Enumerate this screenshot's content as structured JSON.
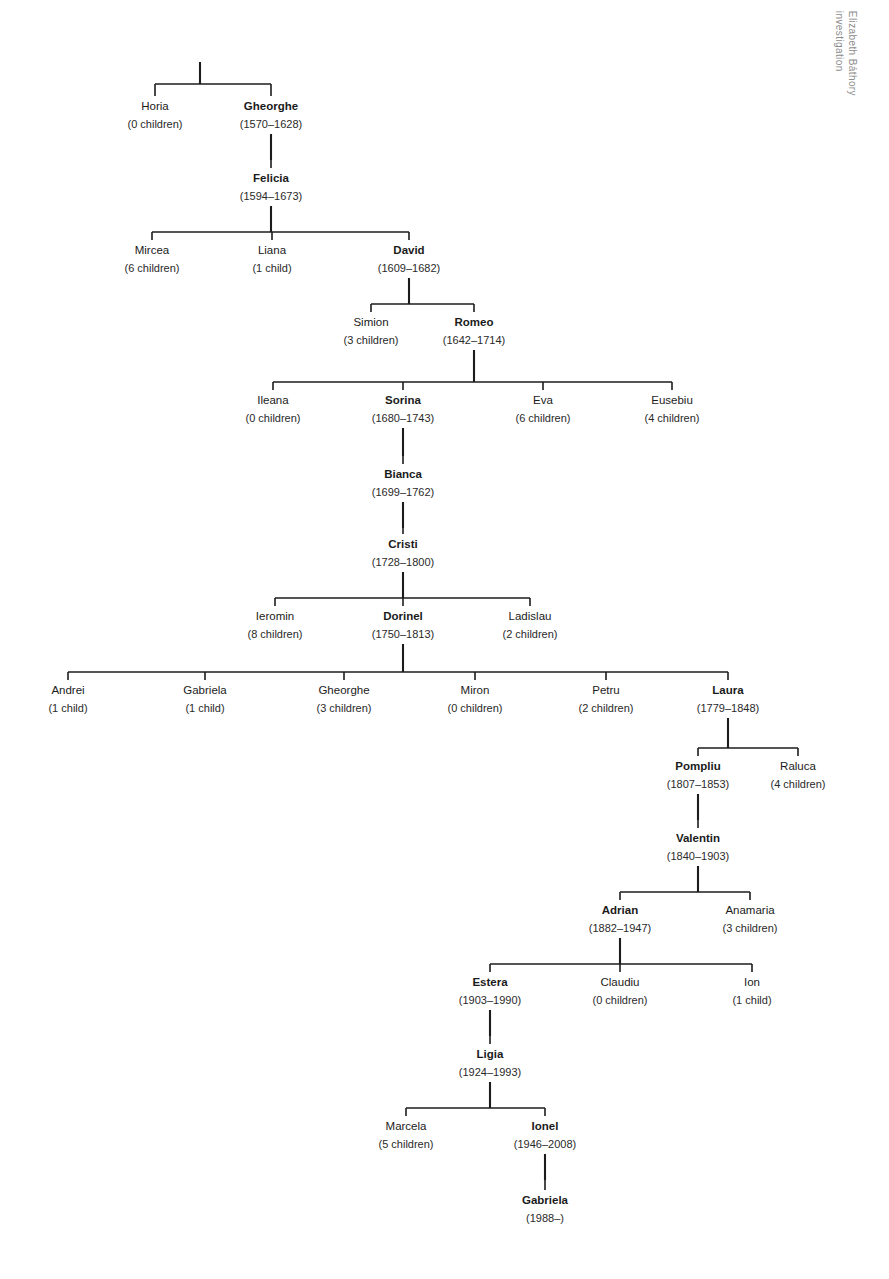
{
  "document": {
    "kind": "family-tree-diagram",
    "side_note_lines": [
      "Elizabeth Báthory",
      "investigation"
    ]
  },
  "style": {
    "background": "#ffffff",
    "ink": "#1c1c1c",
    "text": "#1b1b1b",
    "note_color": "#8c8c8c"
  },
  "chart_data": {
    "type": "tree",
    "title": "",
    "root_label": ""
  },
  "tree": {
    "generations": [
      {
        "id": "gen1",
        "y_name": 110,
        "y_sub": 128,
        "nodes": [
          {
            "id": "horia",
            "name": "Horia",
            "sub": "(0 children)",
            "x": 155,
            "bold": false
          },
          {
            "id": "gheorghe1",
            "name": "Gheorghe",
            "sub": "(1570–1628)",
            "x": 271,
            "bold": true
          }
        ]
      },
      {
        "id": "gen2",
        "y_name": 182,
        "y_sub": 200,
        "nodes": [
          {
            "id": "felicia",
            "name": "Felicia",
            "sub": "(1594–1673)",
            "x": 271,
            "bold": true
          }
        ]
      },
      {
        "id": "gen3",
        "y_name": 254,
        "y_sub": 272,
        "nodes": [
          {
            "id": "mircea",
            "name": "Mircea",
            "sub": "(6 children)",
            "x": 152,
            "bold": false
          },
          {
            "id": "liana",
            "name": "Liana",
            "sub": "(1 child)",
            "x": 272,
            "bold": false
          },
          {
            "id": "david",
            "name": "David",
            "sub": "(1609–1682)",
            "x": 409,
            "bold": true
          }
        ]
      },
      {
        "id": "gen4",
        "y_name": 326,
        "y_sub": 344,
        "nodes": [
          {
            "id": "simion",
            "name": "Simion",
            "sub": "(3 children)",
            "x": 371,
            "bold": false
          },
          {
            "id": "romeo",
            "name": "Romeo",
            "sub": "(1642–1714)",
            "x": 474,
            "bold": true
          }
        ]
      },
      {
        "id": "gen5",
        "y_name": 404,
        "y_sub": 422,
        "nodes": [
          {
            "id": "ileana",
            "name": "Ileana",
            "sub": "(0 children)",
            "x": 273,
            "bold": false
          },
          {
            "id": "sorina",
            "name": "Sorina",
            "sub": "(1680–1743)",
            "x": 403,
            "bold": true
          },
          {
            "id": "eva",
            "name": "Eva",
            "sub": "(6 children)",
            "x": 543,
            "bold": false
          },
          {
            "id": "eusebiu",
            "name": "Eusebiu",
            "sub": "(4 children)",
            "x": 672,
            "bold": false
          }
        ]
      },
      {
        "id": "gen6",
        "y_name": 478,
        "y_sub": 496,
        "nodes": [
          {
            "id": "bianca",
            "name": "Bianca",
            "sub": "(1699–1762)",
            "x": 403,
            "bold": true
          }
        ]
      },
      {
        "id": "gen7",
        "y_name": 548,
        "y_sub": 566,
        "nodes": [
          {
            "id": "cristi",
            "name": "Cristi",
            "sub": "(1728–1800)",
            "x": 403,
            "bold": true
          }
        ]
      },
      {
        "id": "gen8",
        "y_name": 620,
        "y_sub": 638,
        "nodes": [
          {
            "id": "ieromin",
            "name": "Ieromin",
            "sub": "(8 children)",
            "x": 275,
            "bold": false
          },
          {
            "id": "dorinel",
            "name": "Dorinel",
            "sub": "(1750–1813)",
            "x": 403,
            "bold": true
          },
          {
            "id": "ladislau",
            "name": "Ladislau",
            "sub": "(2 children)",
            "x": 530,
            "bold": false
          }
        ]
      },
      {
        "id": "gen9",
        "y_name": 694,
        "y_sub": 712,
        "nodes": [
          {
            "id": "andrei",
            "name": "Andrei",
            "sub": "(1 child)",
            "x": 68,
            "bold": false
          },
          {
            "id": "gabriela1",
            "name": "Gabriela",
            "sub": "(1 child)",
            "x": 205,
            "bold": false
          },
          {
            "id": "gheorghe2",
            "name": "Gheorghe",
            "sub": "(3 children)",
            "x": 344,
            "bold": false
          },
          {
            "id": "miron",
            "name": "Miron",
            "sub": "(0 children)",
            "x": 475,
            "bold": false
          },
          {
            "id": "petru",
            "name": "Petru",
            "sub": "(2 children)",
            "x": 606,
            "bold": false
          },
          {
            "id": "laura",
            "name": "Laura",
            "sub": "(1779–1848)",
            "x": 728,
            "bold": true
          }
        ]
      },
      {
        "id": "gen10",
        "y_name": 770,
        "y_sub": 788,
        "nodes": [
          {
            "id": "pompliu",
            "name": "Pompliu",
            "sub": "(1807–1853)",
            "x": 698,
            "bold": true
          },
          {
            "id": "raluca",
            "name": "Raluca",
            "sub": "(4 children)",
            "x": 798,
            "bold": false
          }
        ]
      },
      {
        "id": "gen11",
        "y_name": 842,
        "y_sub": 860,
        "nodes": [
          {
            "id": "valentin",
            "name": "Valentin",
            "sub": "(1840–1903)",
            "x": 698,
            "bold": true
          }
        ]
      },
      {
        "id": "gen12",
        "y_name": 914,
        "y_sub": 932,
        "nodes": [
          {
            "id": "adrian",
            "name": "Adrian",
            "sub": "(1882–1947)",
            "x": 620,
            "bold": true
          },
          {
            "id": "anamaria",
            "name": "Anamaria",
            "sub": "(3 children)",
            "x": 750,
            "bold": false
          }
        ]
      },
      {
        "id": "gen13",
        "y_name": 986,
        "y_sub": 1004,
        "nodes": [
          {
            "id": "estera",
            "name": "Estera",
            "sub": "(1903–1990)",
            "x": 490,
            "bold": true
          },
          {
            "id": "claudiu",
            "name": "Claudiu",
            "sub": "(0 children)",
            "x": 620,
            "bold": false
          },
          {
            "id": "ion",
            "name": "Ion",
            "sub": "(1 child)",
            "x": 752,
            "bold": false
          }
        ]
      },
      {
        "id": "gen14",
        "y_name": 1058,
        "y_sub": 1076,
        "nodes": [
          {
            "id": "ligia",
            "name": "Ligia",
            "sub": "(1924–1993)",
            "x": 490,
            "bold": true
          }
        ]
      },
      {
        "id": "gen15",
        "y_name": 1130,
        "y_sub": 1148,
        "nodes": [
          {
            "id": "marcela",
            "name": "Marcela",
            "sub": "(5 children)",
            "x": 406,
            "bold": false
          },
          {
            "id": "ionel",
            "name": "Ionel",
            "sub": "(1946–2008)",
            "x": 545,
            "bold": true
          }
        ]
      },
      {
        "id": "gen16",
        "y_name": 1204,
        "y_sub": 1222,
        "nodes": [
          {
            "id": "gabriela2",
            "name": "Gabriela",
            "sub": "(1988–)",
            "x": 545,
            "bold": true
          }
        ]
      }
    ],
    "edges": [
      {
        "id": "root-stub",
        "parent_x": 200,
        "parent_y": 62,
        "bar_y": 84,
        "child_y": 96,
        "children_x": [
          155,
          271
        ]
      },
      {
        "id": "gheorghe-felicia",
        "parent_x": 271,
        "parent_y": 134,
        "bar_y": 160,
        "child_y": 168,
        "children_x": [
          271
        ]
      },
      {
        "id": "felicia-kids",
        "parent_x": 271,
        "parent_y": 206,
        "bar_y": 232,
        "child_y": 240,
        "children_x": [
          152,
          272,
          409
        ]
      },
      {
        "id": "david-kids",
        "parent_x": 409,
        "parent_y": 278,
        "bar_y": 304,
        "child_y": 312,
        "children_x": [
          371,
          474
        ]
      },
      {
        "id": "romeo-kids",
        "parent_x": 474,
        "parent_y": 350,
        "bar_y": 382,
        "child_y": 390,
        "children_x": [
          273,
          403,
          543,
          672
        ]
      },
      {
        "id": "sorina-bianca",
        "parent_x": 403,
        "parent_y": 428,
        "bar_y": 456,
        "child_y": 464,
        "children_x": [
          403
        ]
      },
      {
        "id": "bianca-cristi",
        "parent_x": 403,
        "parent_y": 502,
        "bar_y": 528,
        "child_y": 534,
        "children_x": [
          403
        ]
      },
      {
        "id": "cristi-kids",
        "parent_x": 403,
        "parent_y": 572,
        "bar_y": 598,
        "child_y": 606,
        "children_x": [
          275,
          403,
          530
        ]
      },
      {
        "id": "dorinel-kids",
        "parent_x": 403,
        "parent_y": 644,
        "bar_y": 672,
        "child_y": 680,
        "children_x": [
          68,
          205,
          344,
          475,
          606,
          728
        ]
      },
      {
        "id": "laura-kids",
        "parent_x": 728,
        "parent_y": 718,
        "bar_y": 748,
        "child_y": 756,
        "children_x": [
          698,
          798
        ]
      },
      {
        "id": "pompliu-valentin",
        "parent_x": 698,
        "parent_y": 794,
        "bar_y": 820,
        "child_y": 828,
        "children_x": [
          698
        ]
      },
      {
        "id": "valentin-kids",
        "parent_x": 698,
        "parent_y": 866,
        "bar_y": 892,
        "child_y": 900,
        "children_x": [
          620,
          750
        ]
      },
      {
        "id": "adrian-kids",
        "parent_x": 620,
        "parent_y": 938,
        "bar_y": 964,
        "child_y": 972,
        "children_x": [
          490,
          620,
          752
        ]
      },
      {
        "id": "estera-ligia",
        "parent_x": 490,
        "parent_y": 1010,
        "bar_y": 1036,
        "child_y": 1044,
        "children_x": [
          490
        ]
      },
      {
        "id": "ligia-kids",
        "parent_x": 490,
        "parent_y": 1082,
        "bar_y": 1108,
        "child_y": 1116,
        "children_x": [
          406,
          545
        ]
      },
      {
        "id": "ionel-gabriela",
        "parent_x": 545,
        "parent_y": 1154,
        "bar_y": 1180,
        "child_y": 1190,
        "children_x": [
          545
        ]
      }
    ]
  }
}
